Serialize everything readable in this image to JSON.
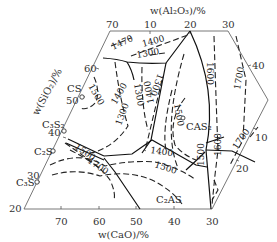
{
  "diagram": {
    "type": "ternary-phase-diagram",
    "axes": {
      "top": {
        "title": "w(Al₂O₃)/%",
        "ticks": [
          "70",
          "10",
          "20",
          "30"
        ]
      },
      "left": {
        "title": "w(SiO₂)/%",
        "ticks": [
          "20",
          "30",
          "40",
          "50",
          "60"
        ]
      },
      "bottom": {
        "title": "w(CaO)/%",
        "ticks": [
          "70",
          "60",
          "50",
          "40",
          "30"
        ]
      },
      "right": {
        "ticks": [
          "40",
          "10",
          "20"
        ]
      }
    },
    "phases": [
      {
        "id": "CS",
        "label": "CS"
      },
      {
        "id": "C3S2",
        "label": "C₃S₂"
      },
      {
        "id": "C2S",
        "label": "C₂S"
      },
      {
        "id": "C3S",
        "label": "C₃S"
      },
      {
        "id": "CAS2",
        "label": "CAS₂"
      },
      {
        "id": "C2AS",
        "label": "C₂AS"
      }
    ],
    "isotherms": [
      "1470",
      "1400",
      "1300",
      "1500",
      "1300",
      "1300",
      "1400",
      "1600",
      "1700",
      "1500",
      "1400",
      "1300",
      "1500",
      "1700",
      "1400",
      "1500",
      "1500",
      "1600",
      "1700"
    ]
  }
}
